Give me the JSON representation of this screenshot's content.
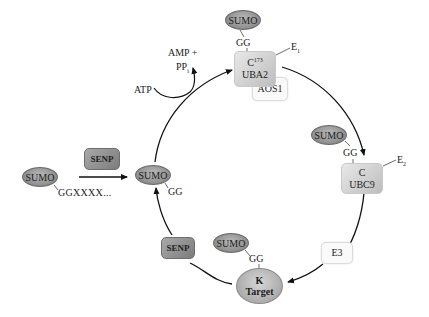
{
  "diagram": {
    "precursor": {
      "sumo": "SUMO",
      "tail": "GGXXXX..."
    },
    "processing_enzyme": "SENP",
    "mature": {
      "sumo": "SUMO",
      "tail": "GG"
    },
    "activation": {
      "atp": "ATP",
      "products_line1": "AMP +",
      "products_line2": "PP",
      "products_sub": "i"
    },
    "e1": {
      "sumo": "SUMO",
      "linker": "GG",
      "residue": "C",
      "residue_sup": "173",
      "name": "UBA2",
      "partner": "AOS1",
      "label": "E",
      "label_sub": "1"
    },
    "e2": {
      "sumo": "SUMO",
      "linker": "GG",
      "residue": "C",
      "name": "UBC9",
      "label": "E",
      "label_sub": "2"
    },
    "e3": {
      "label": "E3"
    },
    "target": {
      "sumo": "SUMO",
      "linker": "GG",
      "residue": "K",
      "name": "Target"
    },
    "deconjugation_enzyme": "SENP"
  }
}
